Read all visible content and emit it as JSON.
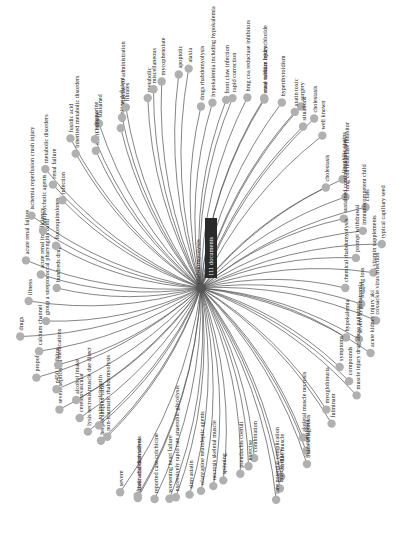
{
  "graph": {
    "center": {
      "label": "rhabdomyolysis",
      "badge": "111 documents"
    },
    "nodes": [
      "drugs rhabdomyolysis",
      "hypokalemia including hypokalemia",
      "front claw infection",
      "rapid correction",
      "hmg coa reductase inhibitors",
      "case sodium hydrochloride",
      "renal tubular injury",
      "hyperthyroidism",
      "surgery",
      "statin toxic",
      "cholestasis",
      "situations",
      "well known",
      "lipophilic statins",
      "cholestasis",
      "hmg coa reductase inhibitor",
      "class",
      "sustained continuous pressure",
      "immunocompetent child",
      "typical capillary seed",
      "prompt withdrawal",
      "vitamin supplements",
      "chemical rhabdomyolysis",
      "fogging loss",
      "coxsackie virus infection",
      "hypokalemia",
      "severe hyponatremia",
      "acute kidney injury aki",
      "symptoms",
      "compounds",
      "muscle injury drug abuse patients",
      "myoglobinuria",
      "fulminant",
      "skeletal muscle necrosis",
      "anesthesia",
      "fluids antagonists",
      "cardiac muscle",
      "muscle injury",
      "rare potential complication",
      "combination",
      "exercise",
      "pseudochis coeruli",
      "spinning",
      "necrosis skeletal muscle",
      "olanzapine neuroleptic agents",
      "simvastatin",
      "excessively rapid rate anaerobic glycolysis",
      "worsening heart failure",
      "reported case colchicine",
      "fibric acid derivatives",
      "toxin rhabdomyolysis",
      "severe",
      "herpes simplex virus",
      "non-traumatic rhabdomyolysis",
      "lysis necrosis muscle due direct",
      "toxins calcineurin",
      "cerebrovascular",
      "severe septicemia",
      "alcohol intake",
      "p450 inhibitor",
      "propofol",
      "medications",
      "calcium channel",
      "drugs",
      "group a streptococcal pharyngitis band",
      "illness",
      "hundreds drugs",
      "acute renal insufficiency",
      "acute renal failure",
      "fluoroquinolones",
      "antipsychotic agents",
      "ischemia reperfusion crush injury",
      "infection",
      "renal failure",
      "metabolic disorders",
      "inherited metabolic disorders",
      "fusidic acid",
      "sustained",
      "illicit cocaine",
      "cyclosporine",
      "carnitine deficient",
      "colchicine co administration",
      "fibrates",
      "metabolic",
      "miscellaneous",
      "mycophenolate",
      "apoptotic",
      "ataxia"
    ]
  }
}
